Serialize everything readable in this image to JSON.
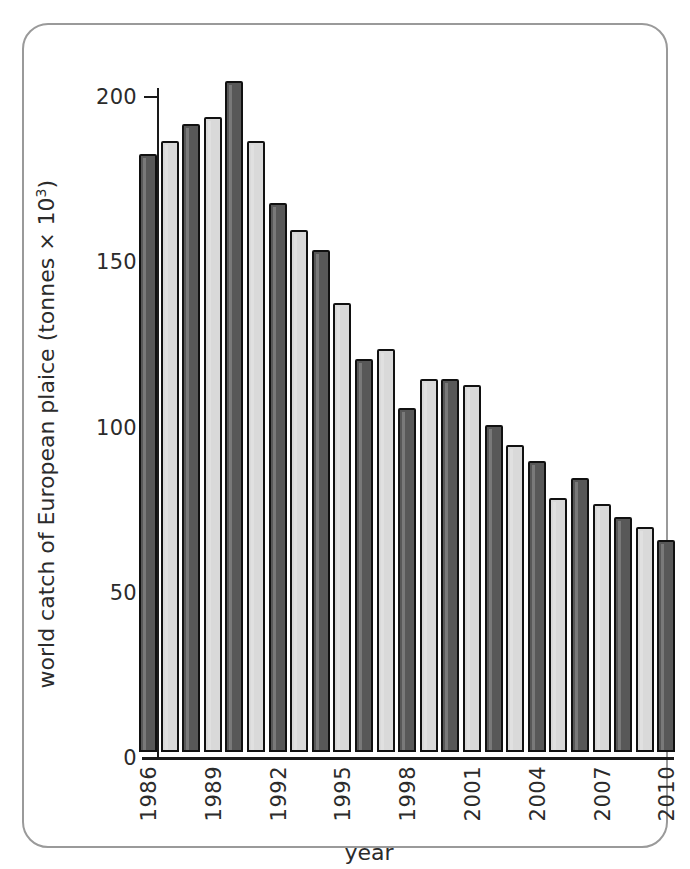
{
  "figure": {
    "frame_color": "#9a9a9a",
    "background": "#ffffff"
  },
  "axes": {
    "x_title": "year",
    "y_title_main": "world catch of European plaice (tonnes × 10",
    "y_title_exponent": "3",
    "y_title_close": ")",
    "y_title_full": "world catch of European plaice (tonnes × 10³)",
    "y_ticks": [
      0,
      50,
      100,
      150,
      200
    ],
    "y_tick_labels": [
      "0",
      "50",
      "100",
      "150",
      "200"
    ],
    "x_tick_labels": [
      "1986",
      "1989",
      "1992",
      "1995",
      "1998",
      "2001",
      "2004",
      "2007",
      "2010"
    ]
  },
  "style": {
    "bar_dark": "#585858",
    "bar_light": "#d9d9d9",
    "bar_outline": "#111111",
    "axis_color": "#1a1a1a",
    "text_color": "#2b2b2b"
  },
  "chart_data": {
    "type": "bar",
    "title": "",
    "subtitle": "",
    "xlabel": "year",
    "ylabel": "world catch of European plaice (tonnes × 10³)",
    "ylim": [
      0,
      205
    ],
    "ytick_values": [
      0,
      50,
      100,
      150,
      200
    ],
    "grid": false,
    "legend": null,
    "categories": [
      "1986",
      "1987",
      "1988",
      "1989",
      "1990",
      "1991",
      "1992",
      "1993",
      "1994",
      "1995",
      "1996",
      "1997",
      "1998",
      "1999",
      "2000",
      "2001",
      "2002",
      "2003",
      "2004",
      "2005",
      "2006",
      "2007",
      "2008",
      "2009",
      "2010"
    ],
    "values": [
      181,
      185,
      190,
      192,
      203,
      185,
      166,
      158,
      152,
      136,
      119,
      122,
      104,
      113,
      113,
      111,
      99,
      93,
      88,
      77,
      83,
      75,
      71,
      68,
      64
    ],
    "bar_shading": [
      "dark",
      "light",
      "dark",
      "light",
      "dark",
      "light",
      "dark",
      "light",
      "dark",
      "light",
      "dark",
      "light",
      "dark",
      "light",
      "dark",
      "light",
      "dark",
      "light",
      "dark",
      "light",
      "dark",
      "light",
      "dark",
      "light",
      "dark"
    ]
  }
}
